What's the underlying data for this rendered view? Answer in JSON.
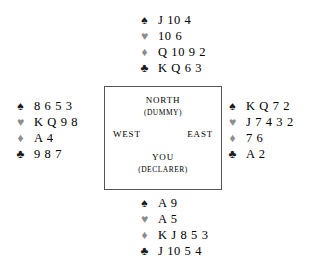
{
  "diagram": {
    "type": "bridge-hand-deal",
    "suit_glyphs": {
      "spade": "♠",
      "heart": "♥",
      "diamond": "♦",
      "club": "♣"
    },
    "suit_colors": {
      "spade": "#1a1a1a",
      "heart": "#8c8c8c",
      "diamond": "#8c8c8c",
      "club": "#1a1a1a"
    },
    "hands": {
      "north": {
        "spades": "J 10 4",
        "hearts": "10 6",
        "diamonds": "Q 10 9 2",
        "clubs": "K Q 6 3"
      },
      "west": {
        "spades": "8 6 5 3",
        "hearts": "K Q 9 8",
        "diamonds": "A 4",
        "clubs": "9 8 7"
      },
      "east": {
        "spades": "K Q 7 2",
        "hearts": "J 7 4 3 2",
        "diamonds": "7 6",
        "clubs": "A 2"
      },
      "south": {
        "spades": "A 9",
        "hearts": "A 5",
        "diamonds": "K J 8 5 3",
        "clubs": "J 10 5 4"
      }
    },
    "compass": {
      "north_label": "NORTH",
      "north_role": "(DUMMY)",
      "west_label": "WEST",
      "east_label": "EAST",
      "south_label": "YOU",
      "south_role": "(DECLARER)"
    }
  }
}
